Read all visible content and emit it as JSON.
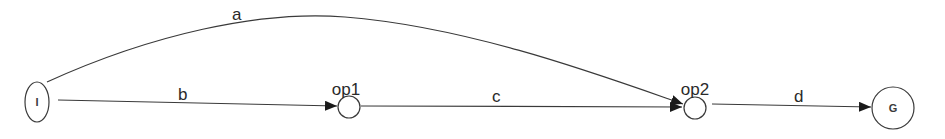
{
  "diagram": {
    "type": "state-transition-graph",
    "colors": {
      "stroke": "#3a3a3a",
      "text": "#2a2a2a",
      "background": "#ffffff"
    },
    "nodes": [
      {
        "id": "I",
        "label": "I",
        "caption": "",
        "shape": "ellipse"
      },
      {
        "id": "op1",
        "label": "",
        "caption": "op1",
        "shape": "circle"
      },
      {
        "id": "op2",
        "label": "",
        "caption": "op2",
        "shape": "circle"
      },
      {
        "id": "G",
        "label": "G",
        "caption": "",
        "shape": "circle"
      }
    ],
    "edges": [
      {
        "id": "a",
        "label": "a",
        "from": "I",
        "to": "op2",
        "style": "curved"
      },
      {
        "id": "b",
        "label": "b",
        "from": "I",
        "to": "op1",
        "style": "straight"
      },
      {
        "id": "c",
        "label": "c",
        "from": "op1",
        "to": "op2",
        "style": "straight"
      },
      {
        "id": "d",
        "label": "d",
        "from": "op2",
        "to": "G",
        "style": "straight"
      }
    ]
  }
}
